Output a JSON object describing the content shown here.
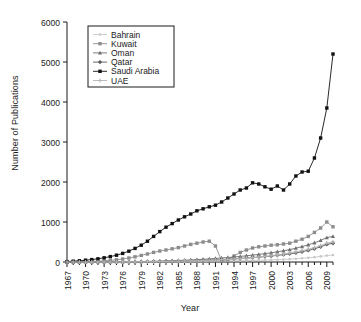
{
  "chart_data": {
    "type": "line",
    "title": "",
    "xlabel": "Year",
    "ylabel": "Number of Publications",
    "xlim": [
      1967,
      2010
    ],
    "ylim": [
      0,
      6000
    ],
    "yticks": [
      0,
      1000,
      2000,
      3000,
      4000,
      5000,
      6000
    ],
    "xticks": [
      1967,
      1970,
      1973,
      1976,
      1979,
      1982,
      1985,
      1988,
      1991,
      1994,
      1997,
      2000,
      2003,
      2006,
      2009
    ],
    "grid": false,
    "legend_position": "top-left",
    "x": [
      1967,
      1968,
      1969,
      1970,
      1971,
      1972,
      1973,
      1974,
      1975,
      1976,
      1977,
      1978,
      1979,
      1980,
      1981,
      1982,
      1983,
      1984,
      1985,
      1986,
      1987,
      1988,
      1989,
      1990,
      1991,
      1992,
      1993,
      1994,
      1995,
      1996,
      1997,
      1998,
      1999,
      2000,
      2001,
      2002,
      2003,
      2004,
      2005,
      2006,
      2007,
      2008,
      2009,
      2010
    ],
    "series": [
      {
        "name": "Bahrain",
        "color": "#c8c8c8",
        "marker": "dot",
        "values": [
          0,
          0,
          0,
          0,
          0,
          0,
          0,
          1,
          1,
          2,
          2,
          3,
          4,
          5,
          6,
          8,
          9,
          10,
          12,
          14,
          16,
          18,
          20,
          22,
          24,
          26,
          28,
          30,
          33,
          36,
          40,
          44,
          48,
          52,
          58,
          64,
          72,
          80,
          92,
          104,
          120,
          140,
          160,
          175
        ]
      },
      {
        "name": "Kuwait",
        "color": "#8c8c8c",
        "marker": "square",
        "values": [
          2,
          4,
          6,
          10,
          14,
          20,
          28,
          40,
          55,
          75,
          100,
          130,
          165,
          200,
          240,
          275,
          300,
          330,
          360,
          400,
          440,
          470,
          500,
          520,
          400,
          30,
          60,
          150,
          240,
          300,
          350,
          380,
          400,
          420,
          430,
          450,
          470,
          520,
          570,
          640,
          740,
          850,
          1000,
          880
        ]
      },
      {
        "name": "Oman",
        "color": "#6e6e6e",
        "marker": "triangle",
        "values": [
          0,
          0,
          0,
          0,
          0,
          1,
          1,
          2,
          3,
          4,
          6,
          8,
          11,
          14,
          18,
          22,
          27,
          32,
          38,
          44,
          52,
          60,
          68,
          78,
          88,
          100,
          112,
          125,
          140,
          155,
          172,
          190,
          210,
          230,
          255,
          280,
          310,
          345,
          385,
          430,
          480,
          540,
          610,
          640
        ]
      },
      {
        "name": "Qatar",
        "color": "#5a5a5a",
        "marker": "diamond",
        "values": [
          0,
          0,
          0,
          0,
          0,
          0,
          1,
          1,
          2,
          3,
          4,
          5,
          7,
          9,
          11,
          14,
          17,
          20,
          24,
          28,
          33,
          38,
          43,
          49,
          55,
          62,
          70,
          78,
          88,
          98,
          110,
          122,
          136,
          150,
          166,
          184,
          204,
          228,
          256,
          290,
          330,
          380,
          440,
          470
        ]
      },
      {
        "name": "Saudi Arabia",
        "color": "#111111",
        "marker": "square-filled",
        "values": [
          10,
          20,
          30,
          45,
          60,
          80,
          105,
          135,
          170,
          215,
          270,
          340,
          420,
          520,
          640,
          760,
          870,
          960,
          1050,
          1130,
          1200,
          1280,
          1330,
          1380,
          1420,
          1500,
          1600,
          1700,
          1800,
          1850,
          1980,
          1950,
          1880,
          1820,
          1900,
          1800,
          1950,
          2150,
          2250,
          2270,
          2600,
          3100,
          3850,
          5200
        ]
      },
      {
        "name": "UAE",
        "color": "#b4b4b4",
        "marker": "plus",
        "values": [
          0,
          0,
          0,
          0,
          0,
          0,
          0,
          1,
          1,
          2,
          3,
          4,
          5,
          7,
          9,
          11,
          14,
          17,
          20,
          24,
          28,
          33,
          38,
          44,
          50,
          58,
          66,
          75,
          86,
          97,
          110,
          124,
          140,
          158,
          178,
          200,
          224,
          252,
          284,
          320,
          360,
          410,
          470,
          500
        ]
      }
    ]
  },
  "legend": {
    "entries": [
      {
        "label": "Bahrain"
      },
      {
        "label": "Kuwait"
      },
      {
        "label": "Oman"
      },
      {
        "label": "Qatar"
      },
      {
        "label": "Saudi Arabia"
      },
      {
        "label": "UAE"
      }
    ]
  }
}
